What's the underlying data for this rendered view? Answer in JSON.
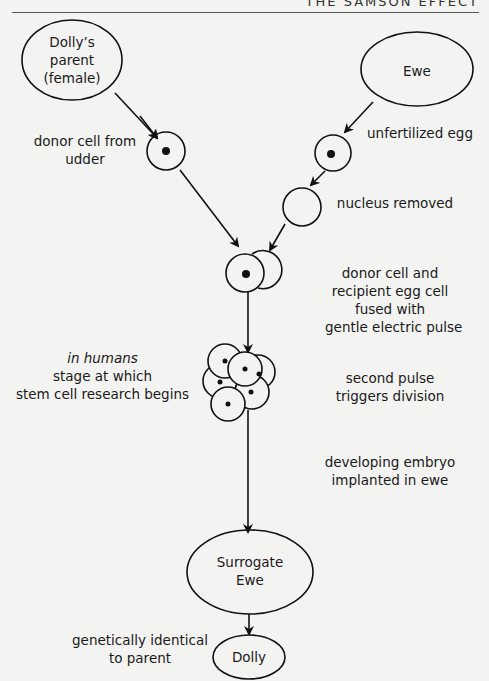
{
  "header": {
    "title": "THE SAMSON EFFECT"
  },
  "nodes": {
    "parent": {
      "line1": "Dolly’s",
      "line2": "parent",
      "line3": "(female)"
    },
    "ewe": {
      "label": "Ewe"
    },
    "surrogate": {
      "line1": "Surrogate",
      "line2": "Ewe"
    },
    "dolly": {
      "label": "Dolly"
    }
  },
  "labels": {
    "donor_cell": {
      "line1": "donor cell from",
      "line2": "udder"
    },
    "unfertilized_egg": "unfertilized egg",
    "nucleus_removed": "nucleus removed",
    "fused": {
      "line1": "donor cell and",
      "line2": "recipient egg cell",
      "line3": "fused with",
      "line4": "gentle electric pulse"
    },
    "humans": {
      "line1": "in humans",
      "line2": "stage at which",
      "line3": "stem cell research begins"
    },
    "second_pulse": {
      "line1": "second pulse",
      "line2": "triggers division"
    },
    "embryo": {
      "line1": "developing embryo",
      "line2": "implanted in ewe"
    },
    "identical": {
      "line1": "genetically identical",
      "line2": "to parent"
    }
  }
}
